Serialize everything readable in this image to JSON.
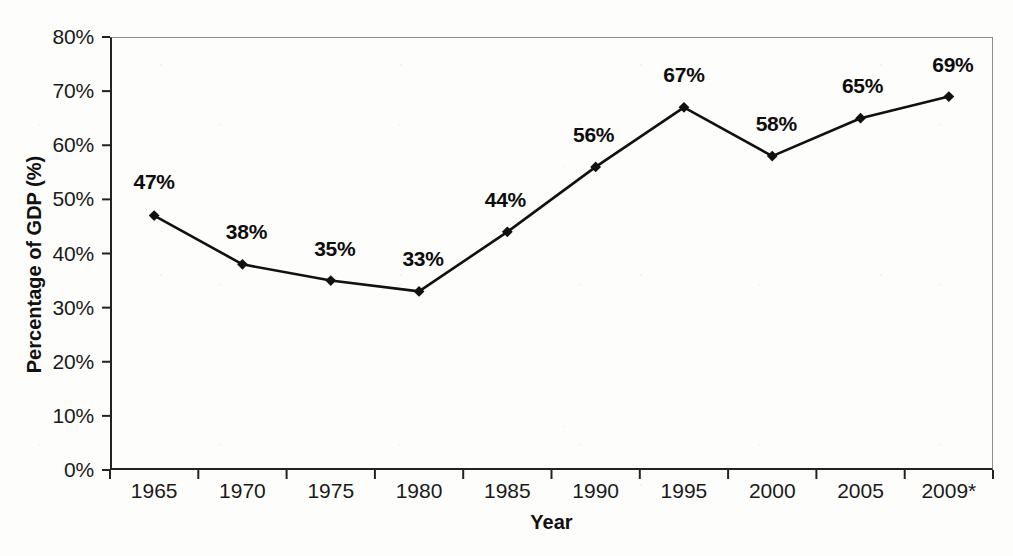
{
  "chart_data": {
    "type": "line",
    "title": "",
    "xlabel": "Year",
    "ylabel": "Percentage of GDP (%)",
    "categories": [
      "1965",
      "1970",
      "1975",
      "1980",
      "1985",
      "1990",
      "1995",
      "2000",
      "2005",
      "2009*"
    ],
    "values": [
      47,
      38,
      35,
      33,
      44,
      56,
      67,
      58,
      65,
      69
    ],
    "point_labels": [
      "47%",
      "38%",
      "35%",
      "33%",
      "44%",
      "56%",
      "67%",
      "58%",
      "65%",
      "69%"
    ],
    "ylim": [
      0,
      80
    ],
    "y_ticks": [
      0,
      10,
      20,
      30,
      40,
      50,
      60,
      70,
      80
    ],
    "y_tick_labels": [
      "0%",
      "10%",
      "20%",
      "30%",
      "40%",
      "50%",
      "60%",
      "70%",
      "80%"
    ],
    "grid": false,
    "legend": false,
    "legend_position": "none",
    "marker": "diamond",
    "series_color": "#111111",
    "axis_color": "#222222",
    "frame_color": "#8d8d8d"
  }
}
